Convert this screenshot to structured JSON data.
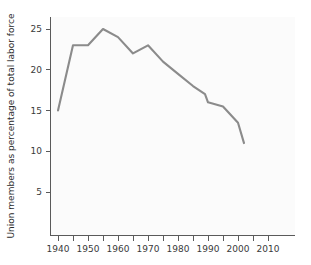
{
  "chart_data": {
    "type": "line",
    "title": "",
    "xlabel": "",
    "ylabel": "Union members as percentage of total labor force",
    "x": [
      1940,
      1945,
      1950,
      1955,
      1960,
      1965,
      1970,
      1975,
      1980,
      1985,
      1989,
      1990,
      1995,
      2000,
      2002
    ],
    "values": [
      15.0,
      23.0,
      23.0,
      25.0,
      24.0,
      22.0,
      23.0,
      21.0,
      19.5,
      18.0,
      17.0,
      16.0,
      15.5,
      13.5,
      11.0
    ],
    "series": [
      {
        "name": "Union membership rate",
        "values": [
          15.0,
          23.0,
          23.0,
          25.0,
          24.0,
          22.0,
          23.0,
          21.0,
          19.5,
          18.0,
          17.0,
          16.0,
          15.5,
          13.5,
          11.0
        ]
      }
    ],
    "xlim": [
      1937,
      2015
    ],
    "ylim": [
      1.5,
      26.8
    ],
    "xticks": [
      1940,
      1950,
      1960,
      1970,
      1980,
      1990,
      2000,
      2010
    ],
    "xtick_labels": [
      "1940",
      "1950",
      "1960",
      "1970",
      "1980",
      "1990",
      "2000",
      "2010"
    ],
    "xticks_minor": [
      1945,
      1955,
      1965,
      1975,
      1985,
      1995,
      2005
    ],
    "yticks": [
      5,
      10,
      15,
      20,
      25
    ],
    "ytick_labels": [
      "5",
      "10",
      "15",
      "20",
      "25"
    ],
    "grid": false,
    "legend": "none",
    "line_color": "#8b8b8b",
    "axis_color": "#5a5a5a",
    "text_color": "#333333",
    "background_color": "#ffffff",
    "plot_background_color": "#fbfbfb"
  }
}
